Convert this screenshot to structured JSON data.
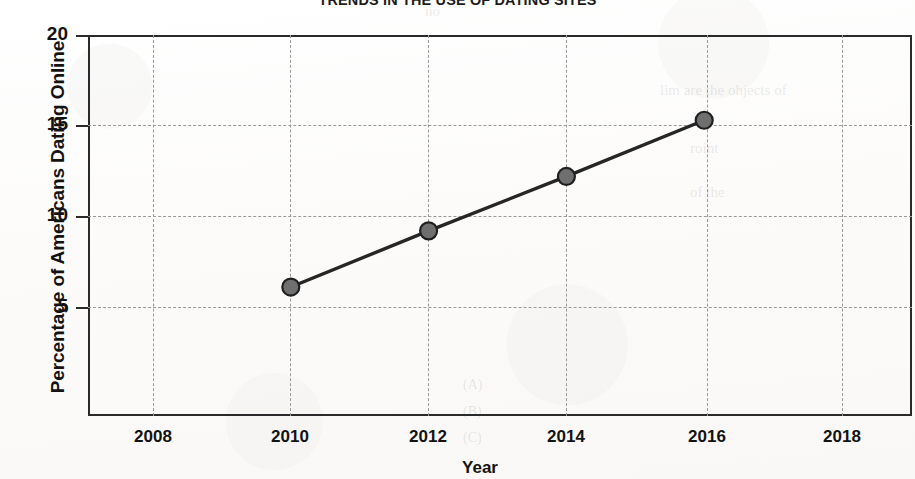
{
  "chart_data": {
    "type": "line",
    "title": "TRENDS IN THE USE OF DATING SITES",
    "xlabel": "Year",
    "ylabel": "Percentage of Americans Dating Online",
    "x": [
      2010,
      2012,
      2014,
      2016
    ],
    "values": [
      6.1,
      9.2,
      12.2,
      15.3
    ],
    "series": [
      {
        "name": "Percentage of Americans Dating Online",
        "x": [
          2010,
          2012,
          2014,
          2016
        ],
        "values": [
          6.1,
          9.2,
          12.2,
          15.3
        ]
      }
    ],
    "xlim": [
      2007,
      2019
    ],
    "ylim": [
      0,
      20
    ],
    "xticks": [
      2008,
      2010,
      2012,
      2014,
      2016,
      2018
    ],
    "xtick_labels": [
      "2008",
      "2010",
      "2012",
      "2014",
      "2016",
      "2018"
    ],
    "yticks": [
      5,
      10,
      15,
      20
    ],
    "ytick_labels": [
      "5",
      "10",
      "15",
      "20"
    ],
    "grid": "dashed-both",
    "legend": "none",
    "line_color": "#262626",
    "marker_color": "#6f6f6f",
    "marker_edge_color": "#1f1f1f",
    "marker_shape": "circle",
    "grid_color": "#9a9a9a",
    "axis_color": "#2a2a2a"
  },
  "page_artifacts": {
    "ghost_lines": [
      "no",
      "lim are the ohjects of",
      "roint",
      "of the",
      "(A)",
      "(B)",
      "(C)"
    ]
  }
}
